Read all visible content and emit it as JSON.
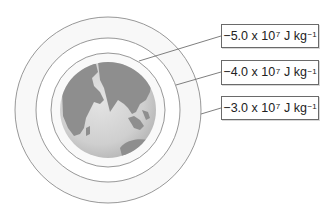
{
  "diagram": {
    "center": [
      108,
      110
    ],
    "globe_radius": 48,
    "colors": {
      "ring_stroke": "#8c8c8c",
      "ring_fill": "#f7f7f7",
      "ocean": "#d2d2d2",
      "land": "#8e8e8e",
      "leader_line": "#707070",
      "box_border": "#6a6a6a"
    },
    "equipotentials": [
      {
        "radius": 57,
        "mantissa": "−5.0 x 10",
        "exponent": "7",
        "unit": "J kg",
        "unit_exponent": "−1",
        "box": {
          "x": 221,
          "y": 24,
          "w": 98,
          "h": 24
        },
        "leader": {
          "from": [
            139,
            61
          ],
          "to": [
            221,
            36
          ]
        }
      },
      {
        "radius": 72,
        "mantissa": "−4.0 x 10",
        "exponent": "7",
        "unit": "J kg",
        "unit_exponent": "−1",
        "box": {
          "x": 221,
          "y": 60,
          "w": 98,
          "h": 25
        },
        "leader": {
          "from": [
            176,
            85
          ],
          "to": [
            221,
            72
          ]
        }
      },
      {
        "radius": 93,
        "mantissa": "−3.0 x 10",
        "exponent": "7",
        "unit": "J kg",
        "unit_exponent": "−1",
        "box": {
          "x": 221,
          "y": 96,
          "w": 98,
          "h": 24
        },
        "leader": {
          "from": [
            201,
            114
          ],
          "to": [
            221,
            108
          ]
        }
      }
    ]
  }
}
